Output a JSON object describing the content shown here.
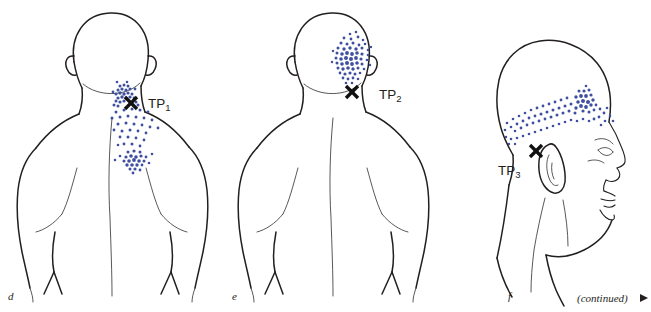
{
  "figure": {
    "type": "anatomical-trigger-point-diagram",
    "background_color": "#ffffff",
    "ink_color": "#231f20",
    "stipple_color": "#3f4fa0",
    "marker_symbol": "X",
    "continued_note": "(continued)",
    "continued_arrow": "▶"
  },
  "panels": [
    {
      "letter": "d",
      "view": "posterior upper back and head",
      "trigger_point_label": "TP",
      "trigger_point_subscript": "1",
      "marker": "X",
      "referral_region": "suboccipital to medial scapular border"
    },
    {
      "letter": "e",
      "view": "posterior upper back and head",
      "trigger_point_label": "TP",
      "trigger_point_subscript": "2",
      "marker": "X",
      "referral_region": "posterolateral occiput"
    },
    {
      "letter": "f",
      "view": "lateral head profile",
      "trigger_point_label": "TP",
      "trigger_point_subscript": "3",
      "marker": "X",
      "referral_region": "temporal band above the ear"
    }
  ]
}
